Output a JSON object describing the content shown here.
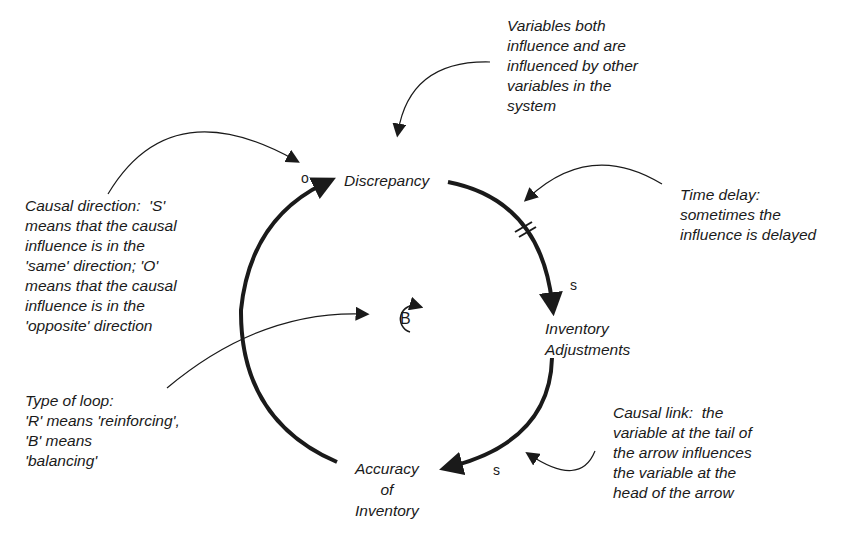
{
  "diagram": {
    "type": "causal-loop-diagram",
    "variables": [
      {
        "id": "discrepancy",
        "label": "Discrepancy"
      },
      {
        "id": "inventory_adjustments",
        "label": "Inventory\nAdjustments"
      },
      {
        "id": "accuracy_of_inventory",
        "label": "Accuracy\nof\nInventory"
      }
    ],
    "links": [
      {
        "from": "discrepancy",
        "to": "inventory_adjustments",
        "polarity": "s",
        "delay": true
      },
      {
        "from": "inventory_adjustments",
        "to": "accuracy_of_inventory",
        "polarity": "s",
        "delay": false
      },
      {
        "from": "accuracy_of_inventory",
        "to": "discrepancy",
        "polarity": "o",
        "delay": false
      }
    ],
    "loop": {
      "type": "B"
    },
    "annotations": {
      "variables": "Variables both\ninfluence and are\ninfluenced by other\nvariables in the\nsystem",
      "causal_direction": "Causal direction:  'S'\nmeans that the causal\ninfluence is in the\n'same' direction; 'O'\nmeans that the causal\ninfluence is in the\n'opposite' direction",
      "time_delay": "Time delay:\nsometimes the\ninfluence is delayed",
      "loop_type": "Type of loop:\n'R' means 'reinforcing',\n'B' means\n'balancing'",
      "causal_link": "Causal link:  the\nvariable at the tail of\nthe arrow influences\nthe variable at the\nhead of the arrow"
    },
    "colors": {
      "ink": "#1a1a1a",
      "background": "#ffffff"
    }
  }
}
